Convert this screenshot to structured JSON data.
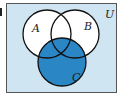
{
  "diagram": {
    "type": "venn",
    "universe_label": "U",
    "sets": [
      {
        "label": "A"
      },
      {
        "label": "B"
      },
      {
        "label": "C"
      }
    ],
    "shaded_region": "C",
    "colors": {
      "universe_fill": "#cfe6f2",
      "shaded_fill": "#2a86c4",
      "unshaded_fill": "#ffffff",
      "stroke": "#111111"
    }
  },
  "left_mark": "|"
}
